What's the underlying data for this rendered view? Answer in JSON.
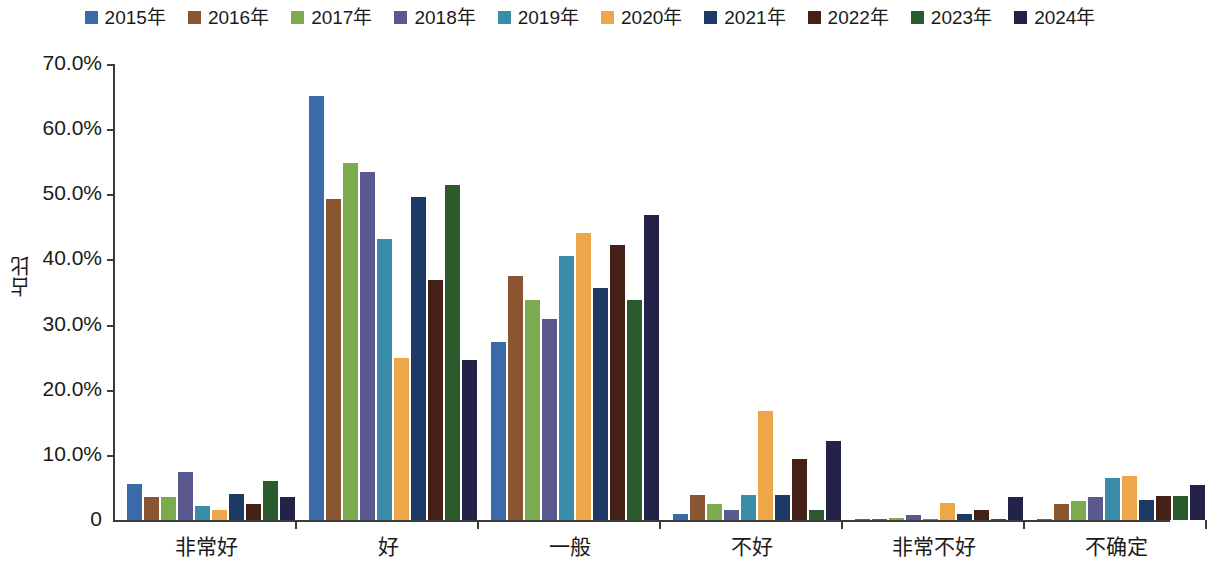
{
  "chart_data": {
    "type": "bar",
    "title": "",
    "xlabel": "",
    "ylabel": "占比",
    "ylim": [
      0,
      70
    ],
    "grid": false,
    "legend_position": "top-center",
    "y_ticks": [
      "0",
      "10.0%",
      "20.0%",
      "30.0%",
      "40.0%",
      "50.0%",
      "60.0%",
      "70.0%"
    ],
    "y_tick_values": [
      0,
      10,
      20,
      30,
      40,
      50,
      60,
      70
    ],
    "categories": [
      "非常好",
      "好",
      "一般",
      "不好",
      "非常不好",
      "不确定"
    ],
    "series": [
      {
        "name": "2015年",
        "color": "#3b6aa8",
        "values": [
          5.6,
          65.1,
          27.4,
          0.9,
          0.0,
          0.0
        ]
      },
      {
        "name": "2016年",
        "color": "#8a5632",
        "values": [
          3.6,
          49.3,
          37.4,
          3.9,
          0.0,
          2.4
        ]
      },
      {
        "name": "2017年",
        "color": "#7bab4e",
        "values": [
          3.5,
          54.8,
          33.7,
          2.5,
          0.3,
          2.9
        ]
      },
      {
        "name": "2018年",
        "color": "#59598f",
        "values": [
          7.4,
          53.5,
          30.9,
          1.6,
          0.8,
          3.5
        ]
      },
      {
        "name": "2019年",
        "color": "#3a8da8",
        "values": [
          2.2,
          43.2,
          40.6,
          3.9,
          0.0,
          6.5
        ]
      },
      {
        "name": "2020年",
        "color": "#eda64a",
        "values": [
          1.5,
          24.9,
          44.0,
          16.7,
          2.6,
          6.7
        ]
      },
      {
        "name": "2021年",
        "color": "#1d3a66",
        "values": [
          4.0,
          49.6,
          35.6,
          3.8,
          0.9,
          3.0
        ]
      },
      {
        "name": "2022年",
        "color": "#452016",
        "values": [
          2.4,
          36.8,
          42.2,
          9.3,
          1.5,
          3.7
        ]
      },
      {
        "name": "2023年",
        "color": "#2b5a2c",
        "values": [
          6.0,
          51.4,
          33.8,
          1.6,
          0.0,
          3.7
        ]
      },
      {
        "name": "2024年",
        "color": "#232349",
        "values": [
          3.5,
          24.6,
          46.8,
          12.2,
          3.5,
          5.3
        ]
      }
    ]
  }
}
